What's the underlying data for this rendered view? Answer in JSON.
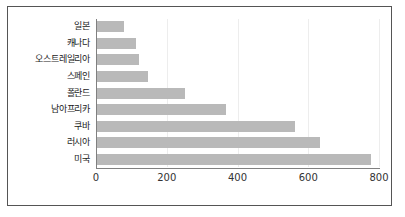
{
  "chart_data": {
    "type": "bar",
    "orientation": "horizontal",
    "title": "",
    "xlabel": "",
    "ylabel": "",
    "categories": [
      "일본",
      "캐나다",
      "오스트레일리아",
      "스페인",
      "폴란드",
      "남아프리카",
      "쿠바",
      "러시아",
      "미국"
    ],
    "values": [
      75,
      110,
      120,
      145,
      250,
      365,
      560,
      630,
      775
    ],
    "xlim": [
      0,
      800
    ],
    "xticks": [
      0,
      200,
      400,
      600,
      800
    ],
    "xtick_labels": [
      "0",
      "200",
      "400",
      "600",
      "800"
    ],
    "grid": true,
    "legend": null,
    "series": [
      {
        "name": "",
        "values": [
          75,
          110,
          120,
          145,
          250,
          365,
          560,
          630,
          775
        ]
      }
    ],
    "colors": {
      "bar_fill": "#b9b9b9",
      "axis_line": "#808080",
      "gridline": "#ededed",
      "frame_border": "#555555",
      "label_text": "#1a1a1a",
      "tick_text": "#333333",
      "background": "#ffffff"
    }
  }
}
